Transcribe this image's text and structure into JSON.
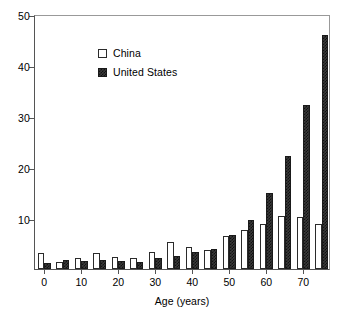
{
  "chart_data": {
    "type": "bar",
    "title": "",
    "xlabel": "Age (years)",
    "ylabel": "",
    "categories": [
      "0",
      "5",
      "10",
      "15",
      "20",
      "25",
      "30",
      "35",
      "40",
      "45",
      "50",
      "55",
      "60",
      "65",
      "70",
      "75"
    ],
    "xtick_labels": [
      "0",
      "10",
      "20",
      "30",
      "40",
      "50",
      "60",
      "70"
    ],
    "xtick_categories": [
      "0",
      "10",
      "20",
      "30",
      "40",
      "50",
      "60",
      "70"
    ],
    "ytick_labels": [
      "10",
      "20",
      "30",
      "40",
      "50"
    ],
    "ylim": [
      0,
      50
    ],
    "grid": false,
    "legend_position": "upper-left-inside",
    "series": [
      {
        "name": "China",
        "color": "#ffffff",
        "values": [
          3.1,
          1.3,
          2.1,
          3.2,
          2.3,
          2.1,
          3.3,
          5.3,
          4.3,
          3.8,
          6.4,
          7.6,
          8.9,
          10.4,
          10.2,
          8.9
        ]
      },
      {
        "name": "United States",
        "color": "#3a3a3a",
        "values": [
          1.2,
          1.8,
          1.5,
          1.8,
          1.5,
          1.3,
          2.1,
          2.6,
          3.3,
          4.0,
          6.6,
          9.6,
          14.9,
          22.2,
          32.2,
          45.8
        ]
      }
    ]
  },
  "legend": {
    "items": [
      {
        "label": "China",
        "swatch": "open-square"
      },
      {
        "label": "United States",
        "swatch": "filled-square"
      }
    ]
  },
  "axes": {
    "x_title": "Age (years)"
  }
}
